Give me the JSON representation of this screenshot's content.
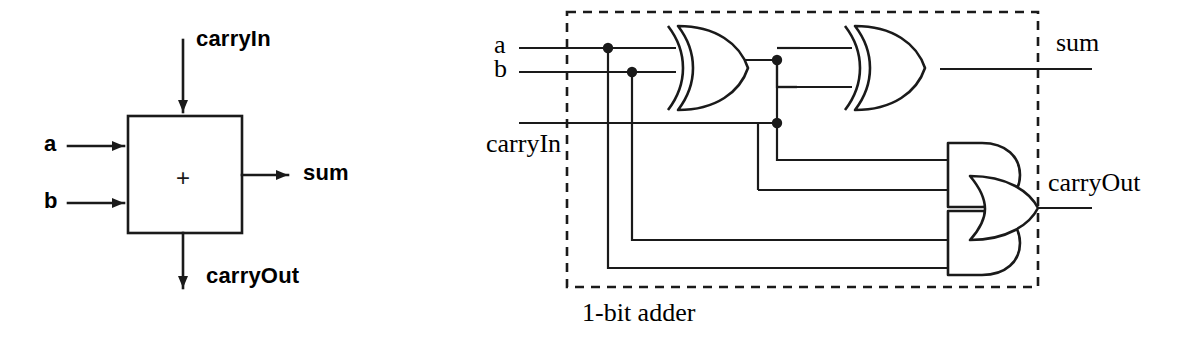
{
  "figure": {
    "domain": "diagram",
    "stroke_color": "#1a1a1a",
    "background_color": "#ffffff"
  },
  "block_diagram": {
    "name": "1-bit adder block symbol",
    "box_operator": "+",
    "inputs": [
      {
        "id": "a",
        "label": "a",
        "side": "left"
      },
      {
        "id": "b",
        "label": "b",
        "side": "left"
      },
      {
        "id": "carryIn",
        "label": "carryIn",
        "side": "top"
      }
    ],
    "outputs": [
      {
        "id": "sum",
        "label": "sum",
        "side": "right"
      },
      {
        "id": "carryOut",
        "label": "carryOut",
        "side": "bottom"
      }
    ]
  },
  "gate_diagram": {
    "name": "gate level 1-bit adder",
    "caption": "1-bit adder",
    "boundary_style": "dashed",
    "inputs": [
      {
        "id": "a",
        "label": "a"
      },
      {
        "id": "b",
        "label": "b"
      },
      {
        "id": "carryIn",
        "label": "carryIn"
      }
    ],
    "outputs": [
      {
        "id": "sum",
        "label": "sum"
      },
      {
        "id": "carryOut",
        "label": "carryOut"
      }
    ],
    "gates": [
      {
        "id": "xor1",
        "type": "XOR",
        "inputs": [
          "a",
          "b"
        ],
        "output": "ab_xor"
      },
      {
        "id": "xor2",
        "type": "XOR",
        "inputs": [
          "ab_xor",
          "carryIn"
        ],
        "output": "sum"
      },
      {
        "id": "and1",
        "type": "AND",
        "inputs": [
          "ab_xor",
          "carryIn"
        ],
        "output": "t1"
      },
      {
        "id": "and2",
        "type": "AND",
        "inputs": [
          "a",
          "b"
        ],
        "output": "t2"
      },
      {
        "id": "or1",
        "type": "OR",
        "inputs": [
          "t1",
          "t2"
        ],
        "output": "carryOut"
      }
    ],
    "junction_dots": 4
  }
}
